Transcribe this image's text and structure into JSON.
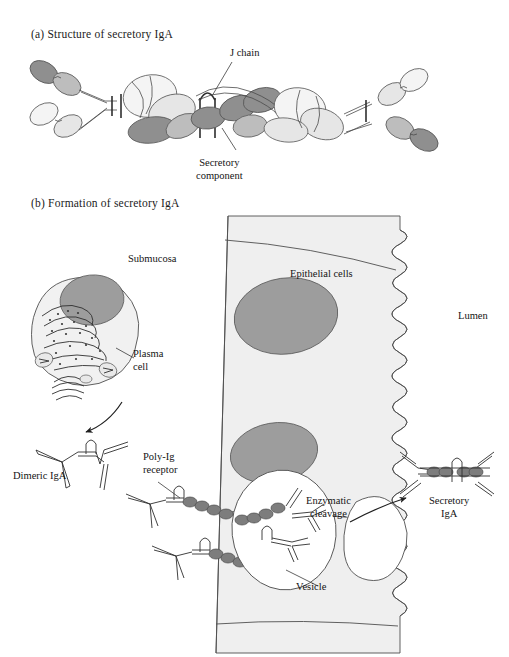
{
  "figure": {
    "panel_a": {
      "title": "(a)  Structure of secretory IgA",
      "labels": {
        "j_chain": "J chain",
        "secretory_component_line1": "Secretory",
        "secretory_component_line2": "component"
      }
    },
    "panel_b": {
      "title": "(b)  Formation of secretory IgA",
      "labels": {
        "submucosa": "Submucosa",
        "plasma_cell_line1": "Plasma",
        "plasma_cell_line2": "cell",
        "dimeric_iga": "Dimeric IgA",
        "poly_ig_receptor_line1": "Poly-Ig",
        "poly_ig_receptor_line2": "receptor",
        "epithelial_cells": "Epithelial cells",
        "lumen": "Lumen",
        "enzymatic_cleavage_line1": "Enzymatic",
        "enzymatic_cleavage_line2": "cleavage",
        "secretory_iga_line1": "Secretory",
        "secretory_iga_line2": "IgA",
        "vesicle": "Vesicle"
      }
    }
  },
  "colors": {
    "background": "#ffffff",
    "outline": "#3d3d3d",
    "text": "#141414",
    "domain_dark_gray": "#8c8c8c",
    "domain_mid_gray": "#b5b5b5",
    "domain_light_gray": "#e2e2e2",
    "domain_pale": "#f1f1f1",
    "nucleus_gray": "#9a9a9a",
    "cytoplasm_fill": "#f0f0f0",
    "epithelium_fill": "#efefef",
    "receptor_bead": "#7a7a7a"
  }
}
